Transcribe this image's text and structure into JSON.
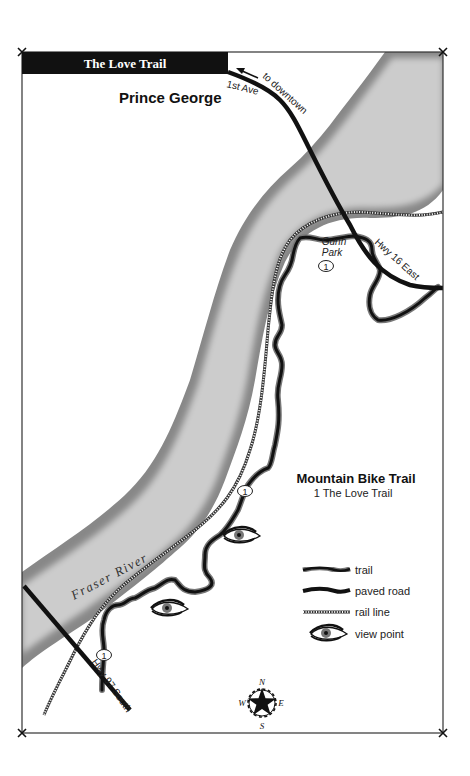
{
  "map": {
    "title": "The Love Trail",
    "city_label": "Prince George",
    "river_label": "Fraser River",
    "roads": {
      "first_ave": "1st Ave",
      "to_downtown": "to downtown",
      "hwy16": "Hwy 16 East",
      "hwy97": "Hwy 97 South"
    },
    "park_label_line1": "Gunn",
    "park_label_line2": "Park",
    "trail_markers": [
      "1",
      "1",
      "1"
    ],
    "info": {
      "heading": "Mountain Bike Trail",
      "item": "1 The Love Trail"
    },
    "legend": {
      "items": [
        {
          "symbol": "trail",
          "label": "trail"
        },
        {
          "symbol": "paved-road",
          "label": "paved road"
        },
        {
          "symbol": "rail-line",
          "label": "rail line"
        },
        {
          "symbol": "view-point",
          "label": "view point"
        }
      ]
    },
    "compass": {
      "n": "N",
      "e": "E",
      "s": "S",
      "w": "W"
    },
    "colors": {
      "title_bar": "#111111",
      "title_text": "#ffffff",
      "river_fill": "#c8c8c8",
      "river_edge": "#777777",
      "road": "#111111",
      "frame": "#333333"
    }
  }
}
